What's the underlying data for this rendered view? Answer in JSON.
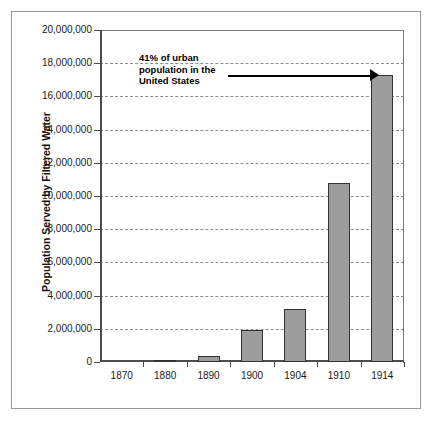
{
  "chart_data": {
    "type": "bar",
    "title": "",
    "subtitle": "",
    "xlabel": "",
    "ylabel": "Population Served by Filtered Water",
    "categories": [
      "1870",
      "1880",
      "1890",
      "1900",
      "1904",
      "1910",
      "1914"
    ],
    "values": [
      0,
      100000,
      350000,
      1900000,
      3200000,
      10800000,
      17300000
    ],
    "series": [
      {
        "name": "Population Served by Filtered Water",
        "values": [
          0,
          100000,
          350000,
          1900000,
          3200000,
          10800000,
          17300000
        ]
      }
    ],
    "ylim": [
      0,
      20000000
    ],
    "ytick_values": [
      0,
      2000000,
      4000000,
      6000000,
      8000000,
      10000000,
      12000000,
      14000000,
      16000000,
      18000000,
      20000000
    ],
    "ytick_labels": [
      "0",
      "2,000,000",
      "4,000,000",
      "6,000,000",
      "8,000,000",
      "10,000,000",
      "12,000,000",
      "14,000,000",
      "16,000,000",
      "18,000,000",
      "20,000,000"
    ],
    "grid": true,
    "grid_style": "dashed-horizontal",
    "legend": false,
    "legend_position": "none",
    "annotations": [
      {
        "text": "41% of urban\npopulation in the\nUnited States",
        "points_to_category": "1914",
        "points_to_value": 17300000,
        "arrow": "right"
      }
    ],
    "bar_fill_color": "#9d9d9d",
    "bar_border_color": "#333333",
    "axis_color": "#4d4d4d",
    "grid_color": "#8d8d8d",
    "background_color": "#ffffff",
    "frame_color": "#9a9a9a"
  }
}
